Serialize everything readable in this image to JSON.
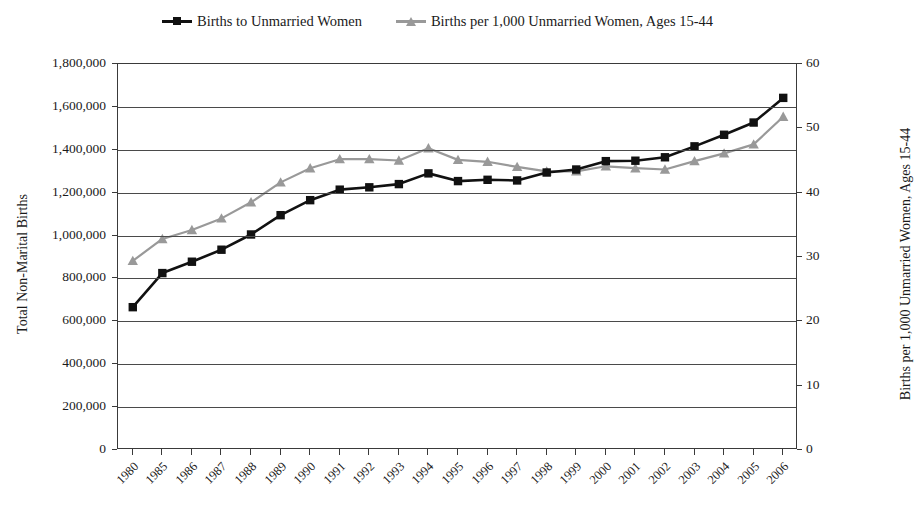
{
  "legend": {
    "items": [
      {
        "label": "Births to Unmarried Women",
        "color": "#111111",
        "marker": "square"
      },
      {
        "label": "Births per 1,000 Unmarried Women, Ages 15-44",
        "color": "#999999",
        "marker": "triangle"
      }
    ]
  },
  "axes": {
    "left_title": "Total Non-Marital Births",
    "right_title": "Births per 1,000 Unmarried Women, Ages 15-44",
    "left_ticks": [
      "1,800,000",
      "1,600,000",
      "1,400,000",
      "1,200,000",
      "1,000,000",
      "800,000",
      "600,000",
      "400,000",
      "200,000",
      "0"
    ],
    "right_ticks": [
      "60",
      "50",
      "40",
      "30",
      "20",
      "10",
      "0"
    ]
  },
  "chart_data": {
    "type": "line",
    "title": "",
    "xlabel": "",
    "ylabel": "Total Non-Marital Births",
    "y2label": "Births per 1,000 Unmarried Women, Ages 15-44",
    "grid": true,
    "legend_position": "top",
    "ylim": [
      0,
      1800000
    ],
    "y2lim": [
      0,
      60
    ],
    "categories": [
      "1980",
      "1985",
      "1986",
      "1987",
      "1988",
      "1989",
      "1990",
      "1991",
      "1992",
      "1993",
      "1994",
      "1995",
      "1996",
      "1997",
      "1998",
      "1999",
      "2000",
      "2001",
      "2002",
      "2003",
      "2004",
      "2005",
      "2006"
    ],
    "series": [
      {
        "name": "Births to Unmarried Women",
        "axis": "left",
        "color": "#111111",
        "marker": "square",
        "values": [
          666000,
          825000,
          878000,
          934000,
          1005000,
          1095000,
          1165000,
          1214000,
          1225000,
          1240000,
          1290000,
          1254000,
          1260000,
          1257000,
          1294000,
          1308000,
          1347000,
          1349000,
          1365000,
          1416000,
          1470000,
          1527000,
          1642000
        ]
      },
      {
        "name": "Births per 1,000 Unmarried Women, Ages 15-44",
        "axis": "right",
        "color": "#999999",
        "marker": "triangle",
        "values": [
          29.4,
          32.8,
          34.2,
          36.0,
          38.5,
          41.6,
          43.8,
          45.2,
          45.2,
          45.0,
          46.9,
          45.1,
          44.8,
          44.0,
          43.3,
          43.3,
          44.1,
          43.8,
          43.6,
          44.9,
          46.1,
          47.5,
          51.8
        ]
      }
    ]
  }
}
